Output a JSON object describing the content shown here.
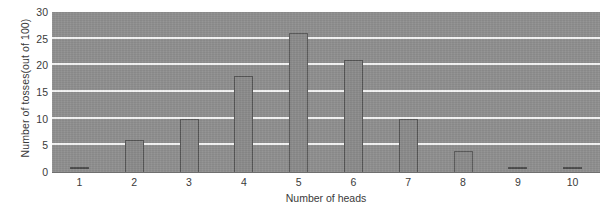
{
  "chart_data": {
    "type": "bar",
    "title": "",
    "subtitle": "",
    "xlabel": "Number of heads",
    "ylabel": "Number of tosses(out of 100)",
    "categories": [
      "1",
      "2",
      "3",
      "4",
      "5",
      "6",
      "7",
      "8",
      "9",
      "10"
    ],
    "values": [
      1,
      6,
      10,
      18,
      26,
      21,
      10,
      4,
      1,
      1
    ],
    "series": [
      {
        "name": "Number of tosses",
        "values": [
          1,
          6,
          10,
          18,
          26,
          21,
          10,
          4,
          1,
          1
        ]
      }
    ],
    "ylim": [
      0,
      30
    ],
    "xlim_categories": 10,
    "ytick_labels": [
      "0",
      "5",
      "10",
      "15",
      "20",
      "25",
      "30"
    ],
    "ytick_values": [
      0,
      5,
      10,
      15,
      20,
      25,
      30
    ],
    "grid": "horizontal",
    "gridline_color": "#f4f4f4",
    "legend": "none",
    "plot_background_color": "#8e8e8e",
    "bar_fill_color": "#8a8a8a",
    "bar_edge_color": "#555555",
    "text_color": "#3a3a3a",
    "figure_background_color": "#ffffff"
  }
}
